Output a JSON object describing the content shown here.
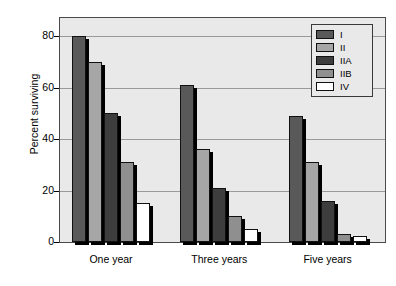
{
  "chart_data": {
    "type": "bar",
    "title": "",
    "subtitle": "",
    "xlabel": "",
    "ylabel": "Percent surviving",
    "categories": [
      "One year",
      "Three years",
      "Five years"
    ],
    "ylim": [
      0,
      85
    ],
    "yticks": [
      0,
      20,
      40,
      60,
      80
    ],
    "ytick_labels": [
      "0",
      "20",
      "40",
      "60",
      "80"
    ],
    "grid": true,
    "grid_axis": "y",
    "legend_position": "top-right",
    "series": [
      {
        "name": "I",
        "color": "#595959",
        "values": [
          80,
          61,
          49
        ]
      },
      {
        "name": "II",
        "color": "#a6a6a6",
        "values": [
          70,
          36,
          31
        ]
      },
      {
        "name": "IIA",
        "color": "#3d3d3d",
        "values": [
          50,
          21,
          16
        ]
      },
      {
        "name": "IIB",
        "color": "#8f8f8f",
        "values": [
          31,
          10,
          3
        ]
      },
      {
        "name": "IV",
        "color": "#ffffff",
        "values": [
          15,
          5,
          2.5
        ]
      }
    ]
  },
  "legend": {
    "items": [
      {
        "label": "I"
      },
      {
        "label": "II"
      },
      {
        "label": "IIA"
      },
      {
        "label": "IIB"
      },
      {
        "label": "IV"
      }
    ]
  },
  "axes": {
    "y_title": "Percent surviving",
    "y_tick_labels": [
      "80",
      "60",
      "40",
      "20",
      "0"
    ],
    "x_group_labels": [
      "One year",
      "Three years",
      "Five years"
    ]
  }
}
